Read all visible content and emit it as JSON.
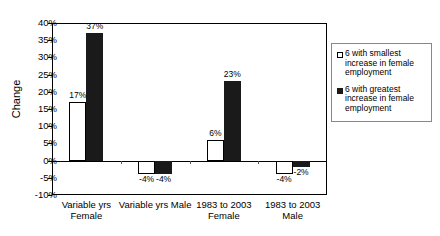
{
  "chart_data": {
    "type": "bar",
    "title": "",
    "xlabel": "",
    "ylabel": "Change",
    "ylim": [
      -10,
      40
    ],
    "ytick_step": 5,
    "grid": false,
    "legend_position": "right-outside",
    "categories": [
      "Variable yrs\nFemale",
      "Variable yrs Male",
      "1983 to 2003\nFemale",
      "1983 to 2003\nMale"
    ],
    "ytick_labels": [
      "40%",
      "35%",
      "30%",
      "25%",
      "20%",
      "15%",
      "10%",
      "5%",
      "0%",
      "-5%",
      "-10%"
    ],
    "ytick_values": [
      40,
      35,
      30,
      25,
      20,
      15,
      10,
      5,
      0,
      -5,
      -10
    ],
    "series": [
      {
        "name": "6 with smallest increase in female employment",
        "style": "open",
        "values": [
          17,
          -4,
          6,
          -4
        ],
        "labels": [
          "17%",
          "-4%",
          "6%",
          "-4%"
        ]
      },
      {
        "name": "6 with greatest increase in female employment",
        "style": "filled",
        "values": [
          37,
          -4,
          23,
          -2
        ],
        "labels": [
          "37%",
          "-4%",
          "23%",
          "-2%"
        ]
      }
    ]
  },
  "legend": {
    "entries": [
      {
        "label": "6 with smallest increase in female employment",
        "style": "open"
      },
      {
        "label": "6 with greatest increase in female employment",
        "style": "filled"
      }
    ]
  },
  "colors": {
    "open_fill": "#ffffff",
    "filled_fill": "#1a1a1a",
    "axis": "#000000",
    "legend_border": "#888888"
  }
}
